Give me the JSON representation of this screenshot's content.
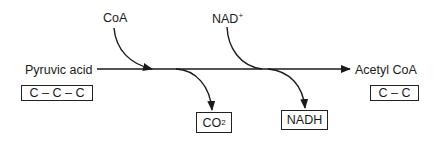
{
  "diagram": {
    "type": "metabolic-reaction-flow",
    "reactant": {
      "name": "Pyruvic acid",
      "carbon_chain": "C – C – C"
    },
    "product": {
      "name": "Acetyl CoA",
      "carbon_chain": "C – C"
    },
    "inputs": [
      {
        "name": "CoA"
      },
      {
        "name": "NAD",
        "superscript": "+"
      }
    ],
    "outputs": [
      {
        "name": "CO",
        "subscript": "2"
      },
      {
        "name": "NADH"
      }
    ],
    "colors": {
      "stroke": "#1a1a1a",
      "background": "#ffffff"
    }
  }
}
